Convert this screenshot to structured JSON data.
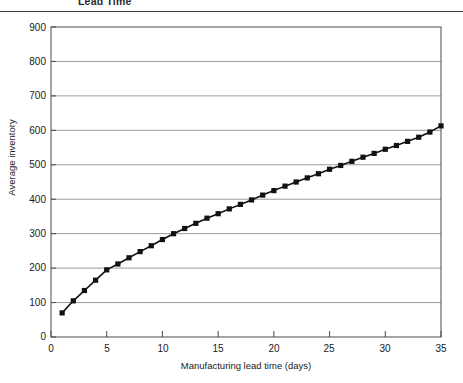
{
  "figure": {
    "title": "Lead Time",
    "title_note": "clipped-caption-at-top-of-image"
  },
  "axes": {
    "y_label": "Average inventory",
    "x_label": "Manufacturing lead time (days)",
    "y_ticks": [
      "0",
      "100",
      "200",
      "300",
      "400",
      "500",
      "600",
      "700",
      "800",
      "900"
    ],
    "x_ticks": [
      "0",
      "5",
      "10",
      "15",
      "20",
      "25",
      "30",
      "35"
    ]
  },
  "colors": {
    "line": "#111111",
    "marker": "#111111",
    "grid": "#9a9a9a",
    "frame": "#4a4a4a",
    "background": "#ffffff"
  },
  "chart_data": {
    "type": "line",
    "title": "Lead Time",
    "xlabel": "Manufacturing lead time (days)",
    "ylabel": "Average inventory",
    "xlim": [
      0,
      35
    ],
    "ylim": [
      0,
      900
    ],
    "xtick_step": 5,
    "ytick_step": 100,
    "grid": "horizontal",
    "legend": "none",
    "marker": "square",
    "series": [
      {
        "name": "Average inventory",
        "x": [
          1,
          2,
          3,
          4,
          5,
          6,
          7,
          8,
          9,
          10,
          11,
          12,
          13,
          14,
          15,
          16,
          17,
          18,
          19,
          20,
          21,
          22,
          23,
          24,
          25,
          26,
          27,
          28,
          29,
          30,
          31,
          32,
          33,
          34,
          35
        ],
        "values": [
          70,
          105,
          135,
          165,
          195,
          212,
          230,
          248,
          265,
          283,
          300,
          315,
          330,
          345,
          358,
          372,
          385,
          398,
          412,
          425,
          438,
          450,
          462,
          474,
          487,
          498,
          510,
          522,
          533,
          545,
          556,
          568,
          580,
          595,
          613
        ]
      }
    ]
  }
}
